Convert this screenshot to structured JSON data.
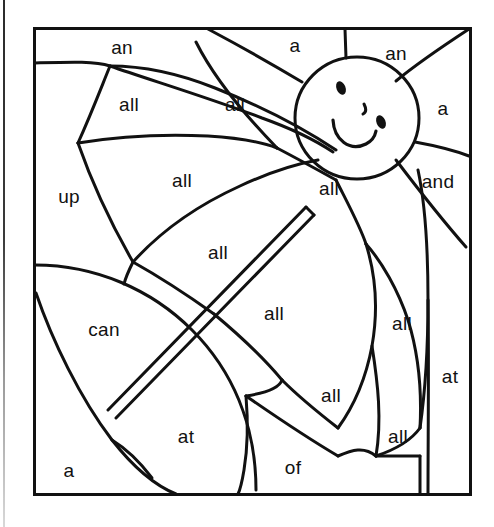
{
  "page": {
    "width": 494,
    "height": 527,
    "background_color": "#ffffff",
    "ink_color": "#111111",
    "style": "black-and-white line-art coloring worksheet"
  },
  "frame": {
    "name": "picture-border",
    "x": 34,
    "y": 28,
    "width": 436,
    "height": 466,
    "stroke_width": 3
  },
  "scan_artifact": {
    "name": "scanner-edge-line",
    "x": 3,
    "width": 2,
    "height": 527
  },
  "illustration": {
    "subject": "open umbrella in front of a smiling sun",
    "elements": [
      "sun-face",
      "sun-rays",
      "umbrella-canopy",
      "umbrella-pole",
      "background-sun-disc"
    ]
  },
  "sun": {
    "name": "sun-face",
    "center_x": 357,
    "center_y": 118,
    "radius_x": 62,
    "radius_y": 61,
    "left_eye": {
      "x": 341,
      "y": 88,
      "rx": 4.5,
      "ry": 7
    },
    "right_eye": {
      "x": 381,
      "y": 122,
      "rx": 4.5,
      "ry": 7
    },
    "nose": {
      "x": 364,
      "y": 110
    },
    "mouth": "smile-arc"
  },
  "regions": [
    {
      "id": "r1",
      "word": "an",
      "x": 122,
      "y": 48,
      "area": "top-left sky strip"
    },
    {
      "id": "r2",
      "word": "a",
      "x": 295,
      "y": 46,
      "area": "top-centre sun ray"
    },
    {
      "id": "r3",
      "word": "an",
      "x": 396,
      "y": 54,
      "area": "top-right sun ray"
    },
    {
      "id": "r4",
      "word": "all",
      "x": 129,
      "y": 105,
      "area": "upper-left canopy panel"
    },
    {
      "id": "r5",
      "word": "all",
      "x": 235,
      "y": 105,
      "area": "upper-centre canopy panel"
    },
    {
      "id": "r6",
      "word": "a",
      "x": 443,
      "y": 109,
      "area": "right sun ray"
    },
    {
      "id": "r7",
      "word": "up",
      "x": 69,
      "y": 197,
      "area": "left canopy tip"
    },
    {
      "id": "r8",
      "word": "all",
      "x": 182,
      "y": 181,
      "area": "centre-left canopy panel"
    },
    {
      "id": "r9",
      "word": "all",
      "x": 329,
      "y": 189,
      "area": "centre-right canopy panel"
    },
    {
      "id": "r10",
      "word": "and",
      "x": 438,
      "y": 182,
      "area": "right sun ray lower"
    },
    {
      "id": "r11",
      "word": "all",
      "x": 218,
      "y": 253,
      "area": "lower-left canopy panel"
    },
    {
      "id": "r12",
      "word": "all",
      "x": 274,
      "y": 314,
      "area": "canopy panel below pole"
    },
    {
      "id": "r13",
      "word": "can",
      "x": 104,
      "y": 330,
      "area": "large sun disc left"
    },
    {
      "id": "r14",
      "word": "all",
      "x": 402,
      "y": 324,
      "area": "right canopy edge panel"
    },
    {
      "id": "r15",
      "word": "all",
      "x": 331,
      "y": 396,
      "area": "lower-centre canopy panel"
    },
    {
      "id": "r16",
      "word": "at",
      "x": 450,
      "y": 377,
      "area": "right border strip"
    },
    {
      "id": "r17",
      "word": "all",
      "x": 398,
      "y": 437,
      "area": "lower-right small panel"
    },
    {
      "id": "r18",
      "word": "at",
      "x": 186,
      "y": 437,
      "area": "bottom-centre sun disc"
    },
    {
      "id": "r19",
      "word": "of",
      "x": 293,
      "y": 468,
      "area": "bottom-centre panel"
    },
    {
      "id": "r20",
      "word": "a",
      "x": 69,
      "y": 471,
      "area": "bottom-left corner"
    }
  ],
  "word_legend": {
    "unique_words": [
      "a",
      "all",
      "an",
      "and",
      "at",
      "can",
      "of",
      "up"
    ],
    "counts": {
      "a": 3,
      "all": 9,
      "an": 2,
      "and": 1,
      "at": 2,
      "can": 1,
      "of": 1,
      "up": 1
    },
    "total_regions": 20
  }
}
